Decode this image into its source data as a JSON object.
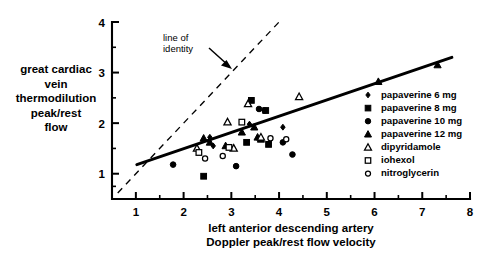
{
  "chart_data": {
    "type": "scatter",
    "title": "",
    "xlabel": "left anterior descending artery Doppler peak/rest flow velocity",
    "ylabel": "great cardiac vein thermodilution peak/rest flow",
    "xlim": [
      0.5,
      8.0
    ],
    "ylim": [
      0.5,
      4.0
    ],
    "xticks": [
      1,
      2,
      3,
      4,
      5,
      6,
      7,
      8
    ],
    "yticks": [
      1,
      2,
      3,
      4
    ],
    "xminor": [
      1.5,
      2.5,
      3.5,
      4.5,
      5.5,
      6.5,
      7.5
    ],
    "yminor": [
      0.75,
      1.5,
      2.5,
      3.5
    ],
    "grid": false,
    "legend_position": "right",
    "xlabel_lines": [
      "left anterior descending artery",
      "Doppler peak/rest flow velocity"
    ],
    "ylabel_lines": [
      "great cardiac",
      "vein",
      "thermodilution",
      "peak/rest",
      "flow"
    ],
    "annotations": [
      {
        "name": "line-of-identity",
        "text_lines": [
          "line of",
          "identity"
        ],
        "x": 1.85,
        "y": 3.62
      }
    ],
    "lines": [
      {
        "name": "line-of-identity",
        "style": "dashed",
        "x": [
          0.62,
          4.02
        ],
        "y": [
          0.62,
          4.02
        ]
      },
      {
        "name": "regression-line",
        "style": "solid",
        "x": [
          1.02,
          7.62
        ],
        "y": [
          1.18,
          3.3
        ]
      }
    ],
    "series": [
      {
        "name": "papaverine 6 mg",
        "marker": "filled-diamond",
        "points": [
          [
            2.55,
            1.72
          ],
          [
            2.62,
            1.55
          ],
          [
            3.38,
            1.98
          ],
          [
            4.08,
            1.92
          ]
        ]
      },
      {
        "name": "papaverine 8 mg",
        "marker": "filled-square",
        "points": [
          [
            2.42,
            0.95
          ],
          [
            3.32,
            1.62
          ],
          [
            3.42,
            2.45
          ],
          [
            3.72,
            2.25
          ],
          [
            3.78,
            1.58
          ]
        ]
      },
      {
        "name": "papaverine 10 mg",
        "marker": "filled-circle",
        "points": [
          [
            1.78,
            1.18
          ],
          [
            3.1,
            1.15
          ],
          [
            3.58,
            2.28
          ],
          [
            3.7,
            2.25
          ],
          [
            4.08,
            1.62
          ],
          [
            4.28,
            1.38
          ]
        ]
      },
      {
        "name": "papaverine 12 mg",
        "marker": "filled-triangle",
        "points": [
          [
            2.42,
            1.7
          ],
          [
            2.55,
            1.62
          ],
          [
            2.88,
            1.55
          ],
          [
            3.22,
            1.82
          ],
          [
            3.48,
            1.92
          ],
          [
            3.55,
            1.72
          ],
          [
            3.62,
            1.68
          ],
          [
            6.08,
            2.82
          ],
          [
            7.32,
            3.15
          ]
        ]
      },
      {
        "name": "dipyridamole",
        "marker": "open-triangle",
        "points": [
          [
            2.28,
            1.5
          ],
          [
            2.92,
            2.02
          ],
          [
            3.05,
            1.5
          ],
          [
            3.35,
            2.38
          ],
          [
            3.62,
            1.72
          ],
          [
            4.42,
            2.52
          ]
        ]
      },
      {
        "name": "iohexol",
        "marker": "open-square",
        "points": [
          [
            2.32,
            1.42
          ],
          [
            2.95,
            1.52
          ],
          [
            3.22,
            2.02
          ]
        ]
      },
      {
        "name": "nitroglycerin",
        "marker": "open-circle",
        "points": [
          [
            2.45,
            1.3
          ],
          [
            2.82,
            1.35
          ],
          [
            3.82,
            1.7
          ],
          [
            4.15,
            1.68
          ]
        ]
      }
    ],
    "legend": [
      {
        "label": "papaverine 6 mg",
        "marker": "filled-diamond"
      },
      {
        "label": "papaverine 8 mg",
        "marker": "filled-square"
      },
      {
        "label": "papaverine 10 mg",
        "marker": "filled-circle"
      },
      {
        "label": "papaverine 12 mg",
        "marker": "filled-triangle"
      },
      {
        "label": "dipyridamole",
        "marker": "open-triangle"
      },
      {
        "label": "iohexol",
        "marker": "open-square"
      },
      {
        "label": "nitroglycerin",
        "marker": "open-circle"
      }
    ]
  }
}
